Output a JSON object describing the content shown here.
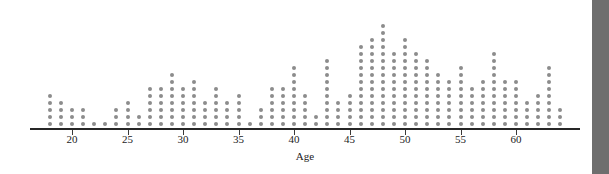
{
  "chart_data": {
    "type": "bar",
    "plot_style": "dotplot",
    "title": "",
    "subtitle": "",
    "xlabel": "Age",
    "ylabel": "",
    "legend": [],
    "grid": false,
    "axis": {
      "x_tick_labels": [
        "20",
        "25",
        "30",
        "35",
        "40",
        "45",
        "50",
        "55",
        "60"
      ],
      "x_tick_values": [
        20,
        25,
        30,
        35,
        40,
        45,
        50,
        55,
        60
      ],
      "xlim": [
        17,
        65
      ],
      "ylim": [
        0,
        16
      ],
      "y_axis_visible": false
    },
    "dot_value": 1,
    "categories": [
      18,
      19,
      20,
      21,
      22,
      23,
      24,
      25,
      26,
      27,
      28,
      29,
      30,
      31,
      32,
      33,
      34,
      35,
      36,
      37,
      38,
      39,
      40,
      41,
      42,
      43,
      44,
      45,
      46,
      47,
      48,
      49,
      50,
      51,
      52,
      53,
      54,
      55,
      56,
      57,
      58,
      59,
      60,
      61,
      62,
      63,
      64
    ],
    "values": [
      5,
      4,
      3,
      3,
      1,
      1,
      3,
      4,
      2,
      6,
      6,
      8,
      6,
      7,
      4,
      6,
      4,
      5,
      1,
      3,
      6,
      6,
      9,
      5,
      2,
      10,
      4,
      5,
      12,
      13,
      15,
      11,
      13,
      11,
      10,
      8,
      7,
      9,
      6,
      7,
      11,
      7,
      7,
      4,
      5,
      9,
      3
    ],
    "colors": {
      "dot": "#8c8c8c",
      "axis": "#262626",
      "text": "#1c1c1c",
      "background": "#ffffff",
      "edge_band": "#6e6e6e"
    }
  },
  "layout": {
    "plot_left_px": 30,
    "plot_baseline_px": 127,
    "px_per_year": 11.1,
    "x_origin_value": 20,
    "x_origin_px": 72,
    "dot_pitch_y_px": 7,
    "dot_size_px": 4,
    "axis_line_y_px": 128,
    "axis_line_left_px": 30,
    "axis_line_right_px": 580,
    "tick_label_y_px": 133,
    "x_title_y_px": 150,
    "x_title_center_px": 305,
    "edge_band_left_px": 592,
    "edge_band_width_px": 17,
    "edge_gap_left_px": 586,
    "edge_gap_width_px": 6
  }
}
